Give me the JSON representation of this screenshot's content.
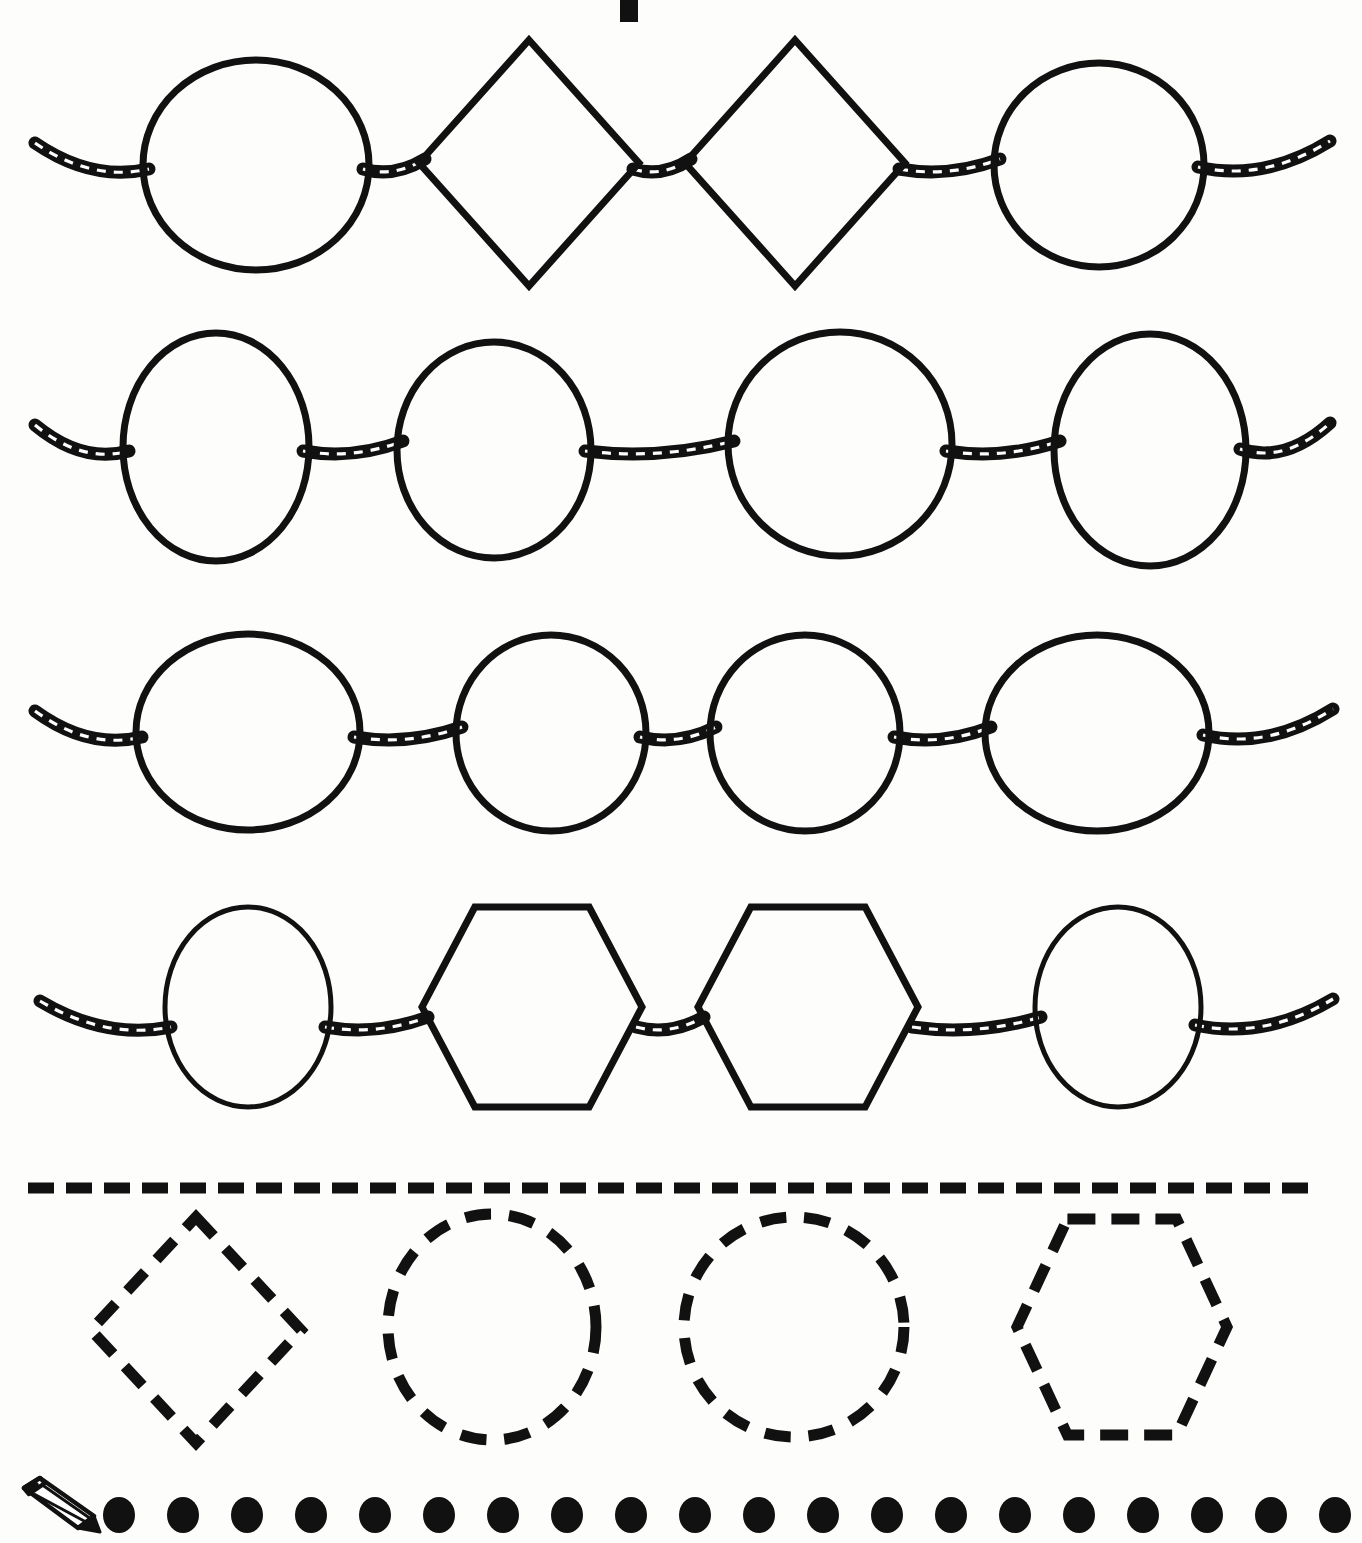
{
  "worksheet": {
    "title": "",
    "type": "bead-pattern-tracing-worksheet",
    "background_color": "#fdfdfc",
    "ink_color": "#111111"
  },
  "top_fragment": {
    "name": "cropped-title-mark",
    "label": "",
    "x": 620,
    "y": 0,
    "width": 18,
    "height": 22
  },
  "bead_rows": [
    {
      "row_label": "row-1",
      "center_y": 165,
      "thread_left_x": 35,
      "thread_right_x": 1330,
      "beads": [
        {
          "shape": "oval",
          "cx": 256,
          "cy": 165,
          "rx": 113,
          "ry": 105,
          "stroke": 7
        },
        {
          "shape": "diamond",
          "cx": 529,
          "cy": 163,
          "half_w": 110,
          "half_h": 123,
          "stroke": 7
        },
        {
          "shape": "diamond",
          "cx": 795,
          "cy": 163,
          "half_w": 110,
          "half_h": 123,
          "stroke": 7
        },
        {
          "shape": "circle",
          "cx": 1099,
          "cy": 165,
          "rx": 105,
          "ry": 102,
          "stroke": 7
        }
      ]
    },
    {
      "row_label": "row-2",
      "center_y": 447,
      "thread_left_x": 35,
      "thread_right_x": 1330,
      "beads": [
        {
          "shape": "oval",
          "cx": 216,
          "cy": 447,
          "rx": 93,
          "ry": 114,
          "stroke": 7
        },
        {
          "shape": "oval",
          "cx": 494,
          "cy": 450,
          "rx": 97,
          "ry": 108,
          "stroke": 7
        },
        {
          "shape": "oval",
          "cx": 840,
          "cy": 444,
          "rx": 112,
          "ry": 112,
          "stroke": 7
        },
        {
          "shape": "oval",
          "cx": 1150,
          "cy": 450,
          "rx": 96,
          "ry": 116,
          "stroke": 7
        }
      ]
    },
    {
      "row_label": "row-3",
      "center_y": 733,
      "thread_left_x": 35,
      "thread_right_x": 1333,
      "beads": [
        {
          "shape": "oval",
          "cx": 248,
          "cy": 732,
          "rx": 112,
          "ry": 98,
          "stroke": 7
        },
        {
          "shape": "circle",
          "cx": 551,
          "cy": 733,
          "rx": 95,
          "ry": 98,
          "stroke": 7
        },
        {
          "shape": "circle",
          "cx": 805,
          "cy": 733,
          "rx": 95,
          "ry": 98,
          "stroke": 7
        },
        {
          "shape": "oval",
          "cx": 1097,
          "cy": 733,
          "rx": 112,
          "ry": 98,
          "stroke": 7
        }
      ]
    },
    {
      "row_label": "row-4",
      "center_y": 1023,
      "thread_left_x": 40,
      "thread_right_x": 1333,
      "beads": [
        {
          "shape": "circle",
          "cx": 248,
          "cy": 1007,
          "rx": 83,
          "ry": 100,
          "stroke": 5
        },
        {
          "shape": "hexagon",
          "cx": 532,
          "cy": 1007,
          "half_w": 110,
          "half_h": 100,
          "stroke": 7
        },
        {
          "shape": "hexagon",
          "cx": 808,
          "cy": 1007,
          "half_w": 110,
          "half_h": 100,
          "stroke": 7
        },
        {
          "shape": "circle",
          "cx": 1118,
          "cy": 1007,
          "rx": 83,
          "ry": 100,
          "stroke": 5
        }
      ]
    }
  ],
  "divider": {
    "name": "dashed-divider-line",
    "y": 1188,
    "x_start": 28,
    "x_end": 1340,
    "dash_length": 26,
    "gap_length": 12,
    "thickness": 11
  },
  "trace_shapes": [
    {
      "name": "trace-diamond",
      "label": "diamond",
      "cx": 196,
      "cy": 1330,
      "half_w": 105,
      "half_h": 113
    },
    {
      "name": "trace-oval",
      "label": "oval",
      "cx": 492,
      "cy": 1327,
      "rx": 104,
      "ry": 113
    },
    {
      "name": "trace-circle",
      "label": "circle",
      "cx": 794,
      "cy": 1327,
      "rx": 110,
      "ry": 110
    },
    {
      "name": "trace-hexagon",
      "label": "hexagon",
      "cx": 1122,
      "cy": 1327,
      "half_w": 105,
      "half_h": 108
    }
  ],
  "footer": {
    "pencil_icon": {
      "name": "pencil-icon",
      "x": 14,
      "y": 1476,
      "width": 88,
      "height": 62
    },
    "dot_row": {
      "name": "tracing-dot-row",
      "count": 20,
      "first_x": 119,
      "spacing": 64,
      "cy": 1515,
      "rx": 16,
      "ry": 18
    }
  }
}
